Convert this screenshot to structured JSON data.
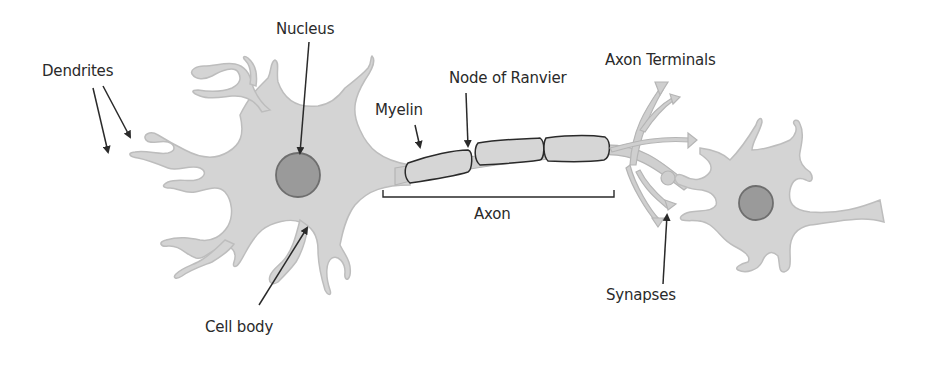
{
  "diagram": {
    "colors": {
      "cell_fill": "#d4d4d4",
      "cell_outline": "#bdbdbd",
      "nucleus_fill": "#9a9a9a",
      "nucleus_outline": "#6e6e6e",
      "line": "#2a2a2a",
      "text": "#2a2a2a"
    },
    "labels": {
      "dendrites": "Dendrites",
      "nucleus": "Nucleus",
      "myelin": "Myelin",
      "node_of_ranvier": "Node of Ranvier",
      "axon_terminals": "Axon Terminals",
      "axon": "Axon",
      "synapses": "Synapses",
      "cell_body": "Cell body"
    }
  }
}
